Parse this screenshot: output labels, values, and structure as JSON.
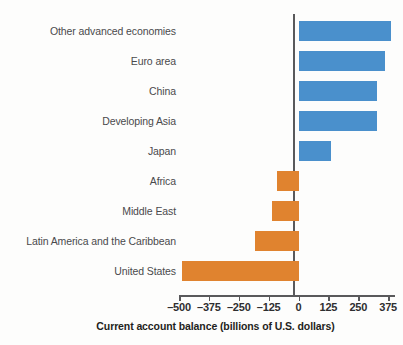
{
  "chart_data": {
    "type": "bar",
    "orientation": "horizontal",
    "title": "",
    "xlabel": "Current account balance (billions of U.S. dollars)",
    "ylabel": "",
    "xlim": [
      -500,
      437
    ],
    "xticks": [
      -500,
      -375,
      -250,
      -125,
      0,
      125,
      250,
      375
    ],
    "xtick_labels": [
      "–500",
      "–375",
      "–250",
      "–125",
      "0",
      "125",
      "250",
      "375"
    ],
    "grid": false,
    "legend": "none",
    "zero_line": 0,
    "categories": [
      "Other advanced economies",
      "Euro area",
      "China",
      "Developing Asia",
      "Japan",
      "Africa",
      "Middle East",
      "Latin America and the Caribbean",
      "United States"
    ],
    "values": [
      385,
      360,
      327,
      327,
      134,
      -88,
      -113,
      -180,
      -486
    ],
    "colors": {
      "positive": "#4a90cc",
      "negative": "#e0832f",
      "axis": "#59595b",
      "label_text": "#4a4a4c",
      "tick_text": "#2e2e30",
      "background": "#fdfdfc"
    }
  }
}
